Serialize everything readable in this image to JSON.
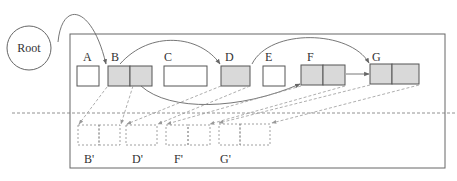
{
  "diagram": {
    "root_label": "Root",
    "colors": {
      "stroke": "#555555",
      "filled": "#d9d9d9",
      "empty": "#ffffff",
      "dashed": "#888888"
    },
    "nodes": [
      {
        "id": "A",
        "label": "A",
        "cells": 1,
        "filled": false
      },
      {
        "id": "B",
        "label": "B",
        "cells": 2,
        "filled": true
      },
      {
        "id": "C",
        "label": "C",
        "cells": 1,
        "filled": false,
        "wide": true
      },
      {
        "id": "D",
        "label": "D",
        "cells": 1,
        "filled": true
      },
      {
        "id": "E",
        "label": "E",
        "cells": 1,
        "filled": false
      },
      {
        "id": "F",
        "label": "F",
        "cells": 2,
        "filled": true
      },
      {
        "id": "G",
        "label": "G",
        "cells": 2,
        "filled": true
      }
    ],
    "copies": [
      {
        "id": "B'",
        "label": "B'",
        "cells": 2
      },
      {
        "id": "D'",
        "label": "D'",
        "cells": 1
      },
      {
        "id": "F'",
        "label": "F'",
        "cells": 2
      },
      {
        "id": "G'",
        "label": "G'",
        "cells": 2
      }
    ],
    "edges": [
      {
        "from": "Root",
        "to": "B",
        "style": "solid"
      },
      {
        "from": "B",
        "to": "D",
        "style": "solid"
      },
      {
        "from": "B",
        "to": "F",
        "style": "solid"
      },
      {
        "from": "D",
        "to": "G",
        "style": "solid"
      },
      {
        "from": "F",
        "to": "G",
        "style": "solid"
      }
    ],
    "copy_edges": [
      {
        "from": "B",
        "to": "B'"
      },
      {
        "from": "D",
        "to": "D'"
      },
      {
        "from": "F",
        "to": "F'"
      },
      {
        "from": "G",
        "to": "G'"
      }
    ]
  }
}
